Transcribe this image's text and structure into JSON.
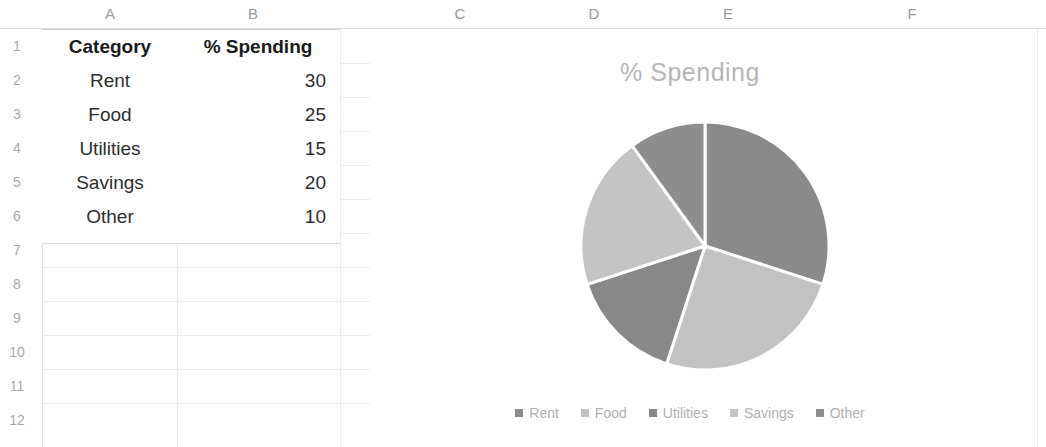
{
  "spreadsheet": {
    "column_headers": [
      "A",
      "B",
      "C",
      "D",
      "E",
      "F"
    ],
    "row_numbers": [
      "1",
      "2",
      "3",
      "4",
      "5",
      "6",
      "7",
      "8",
      "9",
      "10",
      "11",
      "12"
    ],
    "table": {
      "headers": [
        "Category",
        "% Spending"
      ],
      "rows": [
        {
          "category": "Rent",
          "value": "30"
        },
        {
          "category": "Food",
          "value": "25"
        },
        {
          "category": "Utilities",
          "value": "15"
        },
        {
          "category": "Savings",
          "value": "20"
        },
        {
          "category": "Other",
          "value": "10"
        }
      ]
    }
  },
  "chart_data": {
    "type": "pie",
    "title": "% Spending",
    "categories": [
      "Rent",
      "Food",
      "Utilities",
      "Savings",
      "Other"
    ],
    "values": [
      30,
      25,
      15,
      20,
      10
    ],
    "unit": "percent",
    "total": 100,
    "start_angle_deg": 0,
    "direction": "clockwise",
    "colors": [
      "#8a8a8a",
      "#c2c2c2",
      "#888888",
      "#c4c4c4",
      "#8e8e8e"
    ],
    "slice_border_color": "#ffffff",
    "legend": {
      "position": "bottom",
      "entries": [
        "Rent",
        "Food",
        "Utilities",
        "Savings",
        "Other"
      ]
    },
    "title_color": "#b6b6b6",
    "label_color": "#b0b0b0",
    "data_labels": false,
    "grid": false
  }
}
